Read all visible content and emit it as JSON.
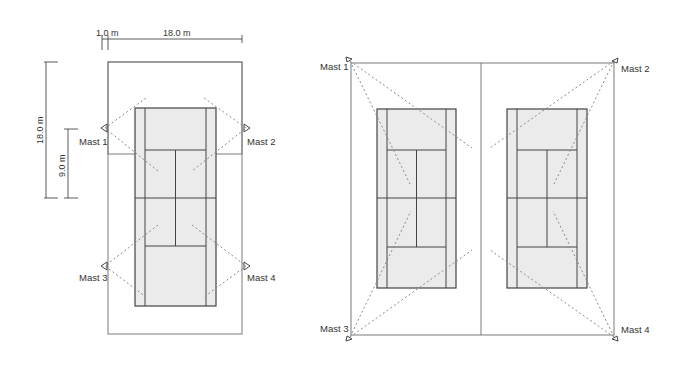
{
  "left_diagram": {
    "dimensions": {
      "top_small": "1.0 m",
      "top_large": "18.0 m",
      "left_outer": "18.0 m",
      "left_inner": "9.0 m"
    },
    "masts": [
      "Mast 1",
      "Mast 2",
      "Mast 3",
      "Mast 4"
    ]
  },
  "right_diagram": {
    "masts": [
      "Mast 1",
      "Mast 2",
      "Mast 3",
      "Mast 4"
    ]
  },
  "colors": {
    "court_fill": "#ebebeb",
    "court_lines": "#444444",
    "field_outline": "#7a7a7a",
    "beam_lines": "#8a8a8a",
    "text": "#333333"
  }
}
